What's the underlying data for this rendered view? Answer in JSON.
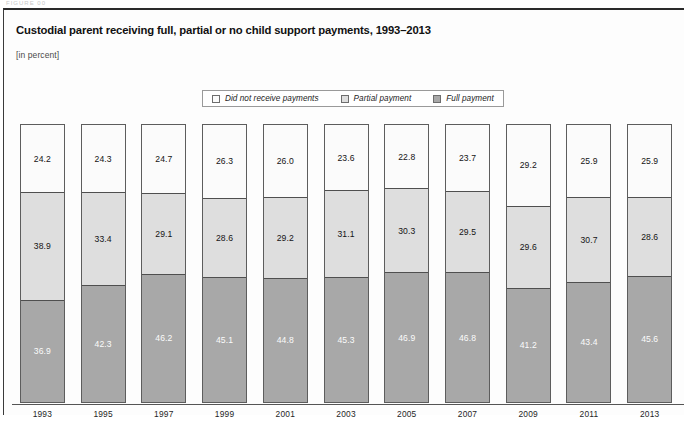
{
  "figure": {
    "running_head": "FIGURE 00",
    "title": "Custodial parent receiving full, partial or no child support payments, 1993–2013",
    "subtitle": "[in percent]"
  },
  "legend": {
    "items": [
      {
        "label": "Did not receive payments",
        "swatch_color": "#fbfbfb",
        "key": "none"
      },
      {
        "label": "Partial payment",
        "swatch_color": "#dedede",
        "key": "partial"
      },
      {
        "label": "Full payment",
        "swatch_color": "#a8a8a8",
        "key": "full"
      }
    ]
  },
  "chart_data": {
    "type": "bar",
    "subtype": "stacked-100-percent",
    "title": "Custodial parent receiving full, partial or no child support payments, 1993–2013",
    "subtitle": "[in percent]",
    "xlabel": "",
    "ylabel": "",
    "ylim": [
      0,
      100
    ],
    "grid": false,
    "legend_position": "top-center",
    "stack_order_top_to_bottom": [
      "Did not receive payments",
      "Partial payment",
      "Full payment"
    ],
    "categories": [
      "1993",
      "1995",
      "1997",
      "1999",
      "2001",
      "2003",
      "2005",
      "2007",
      "2009",
      "2011",
      "2013"
    ],
    "series": [
      {
        "name": "Did not receive payments",
        "color": "#fbfbfb",
        "values": [
          24.2,
          24.3,
          24.7,
          26.3,
          26.0,
          23.6,
          22.8,
          23.7,
          29.2,
          25.9,
          25.9
        ]
      },
      {
        "name": "Partial payment",
        "color": "#dedede",
        "values": [
          38.9,
          33.4,
          29.1,
          28.6,
          29.2,
          31.1,
          30.3,
          29.5,
          29.6,
          30.7,
          28.6
        ]
      },
      {
        "name": "Full payment",
        "color": "#a8a8a8",
        "values": [
          36.9,
          42.3,
          46.2,
          45.1,
          44.8,
          45.3,
          46.9,
          46.8,
          41.2,
          43.4,
          45.6
        ]
      }
    ],
    "data_labels": {
      "1993": {
        "none": "24.2",
        "partial": "38.9",
        "full": "36.9"
      },
      "1995": {
        "none": "24.3",
        "partial": "33.4",
        "full": "42.3"
      },
      "1997": {
        "none": "24.7",
        "partial": "29.1",
        "full": "46.2"
      },
      "1999": {
        "none": "26.3",
        "partial": "28.6",
        "full": "45.1"
      },
      "2001": {
        "none": "26.0",
        "partial": "29.2",
        "full": "44.8"
      },
      "2003": {
        "none": "23.6",
        "partial": "31.1",
        "full": "45.3"
      },
      "2005": {
        "none": "22.8",
        "partial": "30.3",
        "full": "46.9"
      },
      "2007": {
        "none": "23.7",
        "partial": "29.5",
        "full": "46.8"
      },
      "2009": {
        "none": "29.2",
        "partial": "29.6",
        "full": "41.2"
      },
      "2011": {
        "none": "25.9",
        "partial": "30.7",
        "full": "43.4"
      },
      "2013": {
        "none": "25.9",
        "partial": "28.6",
        "full": "45.6"
      }
    }
  }
}
